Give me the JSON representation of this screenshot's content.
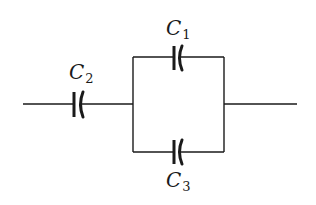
{
  "diagram": {
    "type": "circuit",
    "components": [
      {
        "id": "C1",
        "kind": "capacitor",
        "label": "C",
        "subscript": "1",
        "branch": "parallel-top"
      },
      {
        "id": "C2",
        "kind": "capacitor",
        "label": "C",
        "subscript": "2",
        "branch": "series-left"
      },
      {
        "id": "C3",
        "kind": "capacitor",
        "label": "C",
        "subscript": "3",
        "branch": "parallel-bottom"
      }
    ],
    "connections": [
      {
        "from": "left-terminal",
        "to": "C2"
      },
      {
        "from": "C2",
        "to": "junction-left"
      },
      {
        "from": "junction-left",
        "to": "C1"
      },
      {
        "from": "junction-left",
        "to": "C3"
      },
      {
        "from": "C1",
        "to": "junction-right"
      },
      {
        "from": "C3",
        "to": "junction-right"
      },
      {
        "from": "junction-right",
        "to": "right-terminal"
      }
    ],
    "colors": {
      "ink": "#1a1a1a",
      "background": "#ffffff"
    }
  }
}
